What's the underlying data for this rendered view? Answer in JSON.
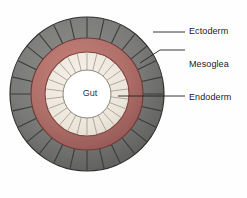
{
  "diagram": {
    "center_label": "Gut",
    "labels": [
      {
        "id": "ectoderm",
        "text": "Ectoderm",
        "layer": "outer",
        "color": "#7a7a78"
      },
      {
        "id": "mesoglea",
        "text": "Mesoglea",
        "layer": "middle",
        "color": "#b5726b"
      },
      {
        "id": "endoderm",
        "text": "Endoderm",
        "layer": "inner",
        "color": "#e8e2d8"
      }
    ],
    "geometry": {
      "center_x": 87,
      "center_y": 94,
      "outer_radius": 77,
      "ectoderm_inner_radius": 56,
      "mesoglea_outer_radius": 56,
      "mesoglea_inner_radius": 42,
      "endoderm_outer_radius": 42,
      "endoderm_inner_radius": 24,
      "gut_radius": 24,
      "ectoderm_segments": 28,
      "endoderm_segments": 26
    },
    "colors": {
      "ectoderm_fill": "#7c7c7a",
      "ectoderm_fill_dark": "#5f5f5d",
      "ectoderm_line": "#3a3a38",
      "mesoglea_fill": "#b5726b",
      "mesoglea_fill_dark": "#9a5b55",
      "mesoglea_line": "#7e443f",
      "endoderm_fill": "#efeae1",
      "endoderm_line": "#a9a093",
      "gut_fill": "#ffffff",
      "outline": "#2e2e2c",
      "leader": "#222222",
      "background": "#ffffff"
    },
    "leaders": [
      {
        "id": "ectoderm",
        "points": "153,32 185,32"
      },
      {
        "id": "mesoglea",
        "points": "140,63 166,63 185,63"
      },
      {
        "id": "endoderm",
        "points": "118,96 185,96"
      }
    ]
  }
}
